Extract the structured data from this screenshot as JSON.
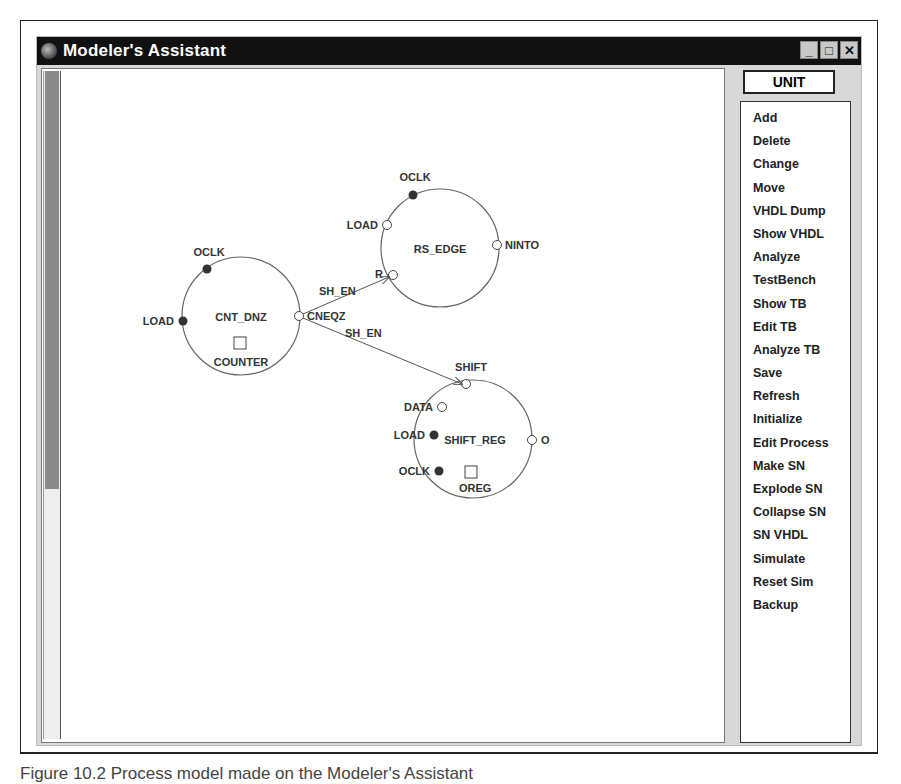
{
  "window": {
    "title": "Modeler's Assistant",
    "controls": [
      "minimize",
      "maximize",
      "close"
    ],
    "minimize_glyph": "_",
    "maximize_glyph": "□",
    "close_glyph": "✕"
  },
  "right_panel": {
    "mode_button": "UNIT",
    "menu_items": [
      "Add",
      "Delete",
      "Change",
      "Move",
      "VHDL Dump",
      "Show VHDL",
      "Analyze",
      "TestBench",
      "Show TB",
      "Edit TB",
      "Analyze TB",
      "Save",
      "Refresh",
      "Initialize",
      "Edit Process",
      "Make SN",
      "Explode SN",
      "Collapse SN",
      "SN VHDL",
      "Simulate",
      "Reset Sim",
      "Backup"
    ]
  },
  "diagram": {
    "processes": [
      {
        "name": "CNT_DNZ",
        "variable": "COUNTER",
        "ports": [
          {
            "label": "OCLK",
            "type": "filled"
          },
          {
            "label": "LOAD",
            "type": "filled"
          },
          {
            "label": "CNEQZ",
            "type": "open"
          }
        ]
      },
      {
        "name": "RS_EDGE",
        "ports": [
          {
            "label": "OCLK",
            "type": "filled"
          },
          {
            "label": "LOAD",
            "type": "open"
          },
          {
            "label": "NINTO",
            "type": "open"
          },
          {
            "label": "R",
            "type": "open"
          }
        ]
      },
      {
        "name": "SHIFT_REG",
        "variable": "OREG",
        "ports": [
          {
            "label": "SHIFT",
            "type": "open"
          },
          {
            "label": "DATA",
            "type": "open"
          },
          {
            "label": "LOAD",
            "type": "filled"
          },
          {
            "label": "OCLK",
            "type": "filled"
          },
          {
            "label": "O",
            "type": "open"
          }
        ]
      }
    ],
    "signals": [
      {
        "label": "SH_EN",
        "from": "CNT_DNZ.CNEQZ",
        "to": "RS_EDGE.R"
      },
      {
        "label": "SH_EN",
        "from": "CNT_DNZ.CNEQZ",
        "to": "SHIFT_REG.SHIFT"
      }
    ]
  },
  "caption": "Figure 10.2   Process model made on the Modeler's Assistant"
}
